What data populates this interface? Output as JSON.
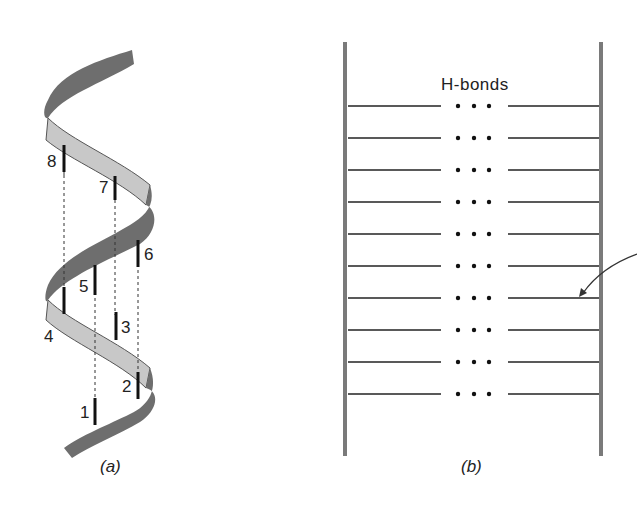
{
  "panel_a": {
    "caption": "(a)",
    "residue_labels": [
      "1",
      "2",
      "3",
      "4",
      "5",
      "6",
      "7",
      "8"
    ],
    "colors": {
      "ribbon_front": "#6e6e6e",
      "ribbon_back": "#c8c8c8",
      "marker": "#111111"
    }
  },
  "panel_b": {
    "caption": "(b)",
    "title": "H-bonds",
    "rung_count": 10,
    "bond_dots": "• • •",
    "colors": {
      "strand": "#7a7a7a",
      "rung": "#222222"
    }
  }
}
